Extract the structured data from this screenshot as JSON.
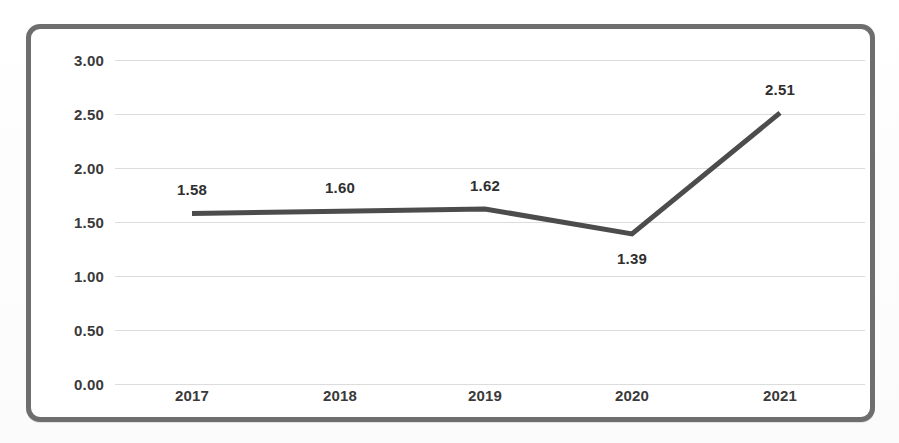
{
  "chart_data": {
    "type": "line",
    "title": "",
    "subtitle": "",
    "xlabel": "",
    "ylabel": "",
    "categories": [
      "2017",
      "2018",
      "2019",
      "2020",
      "2021"
    ],
    "values": [
      1.58,
      1.6,
      1.62,
      1.39,
      2.51
    ],
    "series": [
      {
        "name": "",
        "values": [
          1.58,
          1.6,
          1.62,
          1.39,
          2.51
        ],
        "color": "#4c4c4c",
        "line_width": 5,
        "markers": false
      }
    ],
    "data_labels": [
      "1.58",
      "1.60",
      "1.62",
      "1.39",
      "2.51"
    ],
    "data_label_positions": [
      "above",
      "above",
      "above",
      "below",
      "above"
    ],
    "ylim": [
      0.0,
      3.0
    ],
    "ytick_step": 0.5,
    "ytick_labels": [
      "3.00",
      "2.50",
      "2.00",
      "1.50",
      "1.00",
      "0.50",
      "0.00"
    ],
    "ytick_values": [
      3.0,
      2.5,
      2.0,
      1.5,
      1.0,
      0.5,
      0.0
    ],
    "xtick_labels": [
      "2017",
      "2018",
      "2019",
      "2020",
      "2021"
    ],
    "grid": true,
    "grid_axis": "y",
    "grid_color": "#dcdcdc",
    "legend": false,
    "legend_position": "none",
    "plot_background": "#ffffff",
    "frame_color": "#6e6e6e",
    "text_color": "#3a3a3a"
  }
}
